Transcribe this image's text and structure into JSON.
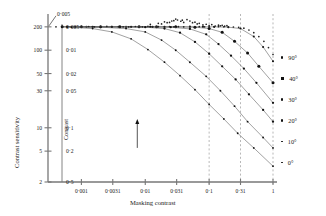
{
  "figure": {
    "background": "#ffffff",
    "ink": "#1a1a1a",
    "axis_color": "#777777",
    "grid_color": "#999999"
  },
  "axes": {
    "x_title": "Masking contrast",
    "y_title_outer": "Contrast sensitivity",
    "y_title_inner": "Contrast",
    "x_ticklabels": [
      "0·001",
      "0·0031",
      "0·01",
      "0·031",
      "0·1",
      "0·31",
      "1"
    ],
    "y_ticklabels_outer": [
      "200",
      "100",
      "50",
      "30",
      "10",
      "5",
      "2"
    ],
    "y_ticklabels_inner": [
      "0·005",
      "0·01",
      "0·02",
      "0·05",
      "0·1",
      "0·2",
      "0·5"
    ],
    "top_corner_label": "0·005"
  },
  "legend": {
    "position": "right",
    "items": [
      {
        "label": "90°",
        "marker": "dot-small"
      },
      {
        "label": "40°",
        "marker": "square"
      },
      {
        "label": "30°",
        "marker": "dot-small"
      },
      {
        "label": "20°",
        "marker": "dot-small"
      },
      {
        "label": "10°",
        "marker": "dot-tiny"
      },
      {
        "label": "0°",
        "marker": "dot-tiny"
      }
    ]
  },
  "chart_data": {
    "type": "scatter",
    "title": "",
    "xlabel": "Masking contrast",
    "ylabel": "Contrast sensitivity",
    "xscale": "log",
    "yscale": "log",
    "xlim": [
      0.0003,
      1.0
    ],
    "ylim": [
      2,
      260
    ],
    "grid": true,
    "gridlines_x": [
      0.1,
      0.31,
      1.0
    ],
    "x_ticks": [
      0.001,
      0.0031,
      0.01,
      0.031,
      0.1,
      0.31,
      1.0
    ],
    "y_ticks_sensitivity": [
      200,
      100,
      50,
      30,
      10,
      5,
      2
    ],
    "y_ticks_contrast": [
      0.005,
      0.01,
      0.02,
      0.05,
      0.1,
      0.2,
      0.5
    ],
    "annotation_arrow": {
      "x": 0.0075,
      "y_from": 5.5,
      "y_to": 13,
      "label": ""
    },
    "series": [
      {
        "name": "90°",
        "knee_x": 0.33,
        "values": [
          [
            0.0005,
            200
          ],
          [
            0.0008,
            200
          ],
          [
            0.0012,
            200
          ],
          [
            0.002,
            200
          ],
          [
            0.003,
            200
          ],
          [
            0.005,
            200
          ],
          [
            0.008,
            200
          ],
          [
            0.013,
            200
          ],
          [
            0.02,
            200
          ],
          [
            0.03,
            200
          ],
          [
            0.05,
            200
          ],
          [
            0.08,
            200
          ],
          [
            0.12,
            200
          ],
          [
            0.2,
            198
          ],
          [
            0.31,
            190
          ],
          [
            0.5,
            150
          ],
          [
            0.7,
            110
          ],
          [
            1.0,
            72
          ]
        ]
      },
      {
        "name": "40°",
        "knee_x": 0.16,
        "values": [
          [
            0.0005,
            200
          ],
          [
            0.001,
            200
          ],
          [
            0.002,
            200
          ],
          [
            0.004,
            200
          ],
          [
            0.008,
            200
          ],
          [
            0.015,
            200
          ],
          [
            0.03,
            200
          ],
          [
            0.06,
            198
          ],
          [
            0.1,
            190
          ],
          [
            0.16,
            170
          ],
          [
            0.25,
            130
          ],
          [
            0.4,
            92
          ],
          [
            0.6,
            62
          ],
          [
            1.0,
            38
          ]
        ]
      },
      {
        "name": "30°",
        "knee_x": 0.09,
        "values": [
          [
            0.0005,
            200
          ],
          [
            0.001,
            200
          ],
          [
            0.003,
            200
          ],
          [
            0.006,
            200
          ],
          [
            0.012,
            200
          ],
          [
            0.025,
            198
          ],
          [
            0.05,
            188
          ],
          [
            0.09,
            160
          ],
          [
            0.14,
            120
          ],
          [
            0.22,
            85
          ],
          [
            0.35,
            58
          ],
          [
            0.55,
            38
          ],
          [
            1.0,
            21
          ]
        ]
      },
      {
        "name": "20°",
        "knee_x": 0.045,
        "values": [
          [
            0.0006,
            200
          ],
          [
            0.0015,
            200
          ],
          [
            0.004,
            200
          ],
          [
            0.01,
            198
          ],
          [
            0.02,
            190
          ],
          [
            0.035,
            168
          ],
          [
            0.06,
            128
          ],
          [
            0.1,
            90
          ],
          [
            0.16,
            62
          ],
          [
            0.26,
            42
          ],
          [
            0.42,
            27
          ],
          [
            0.7,
            17
          ],
          [
            1.0,
            12
          ]
        ]
      },
      {
        "name": "10°",
        "knee_x": 0.02,
        "values": [
          [
            0.0006,
            200
          ],
          [
            0.002,
            198
          ],
          [
            0.005,
            190
          ],
          [
            0.01,
            172
          ],
          [
            0.018,
            135
          ],
          [
            0.03,
            100
          ],
          [
            0.05,
            70
          ],
          [
            0.09,
            46
          ],
          [
            0.15,
            30
          ],
          [
            0.25,
            19
          ],
          [
            0.4,
            12
          ],
          [
            0.7,
            7.5
          ],
          [
            1.0,
            5.5
          ]
        ]
      },
      {
        "name": "0°",
        "knee_x": 0.008,
        "values": [
          [
            0.0007,
            198
          ],
          [
            0.0015,
            190
          ],
          [
            0.003,
            172
          ],
          [
            0.006,
            140
          ],
          [
            0.011,
            102
          ],
          [
            0.02,
            70
          ],
          [
            0.035,
            47
          ],
          [
            0.06,
            31
          ],
          [
            0.1,
            20
          ],
          [
            0.17,
            13
          ],
          [
            0.28,
            8.5
          ],
          [
            0.5,
            5.5
          ],
          [
            1.0,
            3.2
          ]
        ]
      }
    ],
    "scatter_cloud": {
      "name": "threshold-data",
      "points": [
        [
          0.0004,
          200
        ],
        [
          0.0005,
          200
        ],
        [
          0.0006,
          201
        ],
        [
          0.0008,
          200
        ],
        [
          0.001,
          200
        ],
        [
          0.0013,
          202
        ],
        [
          0.0016,
          200
        ],
        [
          0.002,
          200
        ],
        [
          0.0025,
          203
        ],
        [
          0.003,
          200
        ],
        [
          0.0038,
          201
        ],
        [
          0.0045,
          200
        ],
        [
          0.0055,
          200
        ],
        [
          0.007,
          202
        ],
        [
          0.009,
          200
        ],
        [
          0.011,
          203
        ],
        [
          0.013,
          200
        ],
        [
          0.016,
          201
        ],
        [
          0.02,
          200
        ],
        [
          0.024,
          202
        ],
        [
          0.028,
          200
        ],
        [
          0.033,
          201
        ],
        [
          0.04,
          200
        ],
        [
          0.05,
          203
        ],
        [
          0.06,
          200
        ],
        [
          0.07,
          201
        ],
        [
          0.085,
          200
        ],
        [
          0.1,
          202
        ],
        [
          0.12,
          200
        ],
        [
          0.14,
          201
        ],
        [
          0.17,
          200
        ],
        [
          0.2,
          200
        ],
        [
          0.24,
          199
        ],
        [
          0.29,
          197
        ],
        [
          0.35,
          192
        ],
        [
          0.42,
          182
        ],
        [
          0.5,
          168
        ],
        [
          0.6,
          150
        ],
        [
          0.72,
          130
        ],
        [
          0.85,
          108
        ],
        [
          1.0,
          88
        ],
        [
          0.012,
          215
        ],
        [
          0.016,
          222
        ],
        [
          0.02,
          232
        ],
        [
          0.024,
          228
        ],
        [
          0.028,
          240
        ],
        [
          0.032,
          245
        ],
        [
          0.036,
          236
        ],
        [
          0.04,
          228
        ],
        [
          0.045,
          248
        ],
        [
          0.05,
          238
        ],
        [
          0.055,
          226
        ],
        [
          0.06,
          230
        ],
        [
          0.065,
          218
        ],
        [
          0.07,
          222
        ],
        [
          0.08,
          212
        ],
        [
          0.09,
          216
        ],
        [
          0.1,
          208
        ],
        [
          0.11,
          214
        ],
        [
          0.125,
          205
        ],
        [
          0.14,
          210
        ],
        [
          0.03,
          252
        ],
        [
          0.038,
          244
        ],
        [
          0.026,
          238
        ],
        [
          0.022,
          226
        ],
        [
          0.018,
          218
        ],
        [
          0.15,
          206
        ],
        [
          0.16,
          209
        ],
        [
          0.175,
          204
        ],
        [
          0.19,
          207
        ]
      ]
    }
  }
}
